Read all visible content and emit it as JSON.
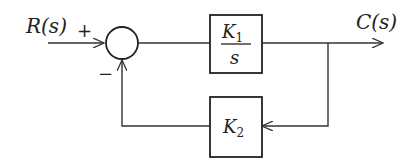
{
  "diagram": {
    "type": "block-diagram",
    "input": {
      "label": "R(s)"
    },
    "output": {
      "label": "C(s)"
    },
    "summing_junction": {
      "plus_sign": "+",
      "minus_sign": "−"
    },
    "forward_block": {
      "numerator": "K",
      "numerator_sub": "1",
      "denominator": "s"
    },
    "feedback_block": {
      "label": "K",
      "label_sub": "2"
    },
    "colors": {
      "line": "#333333",
      "text": "#222222",
      "background": "#ffffff"
    }
  }
}
